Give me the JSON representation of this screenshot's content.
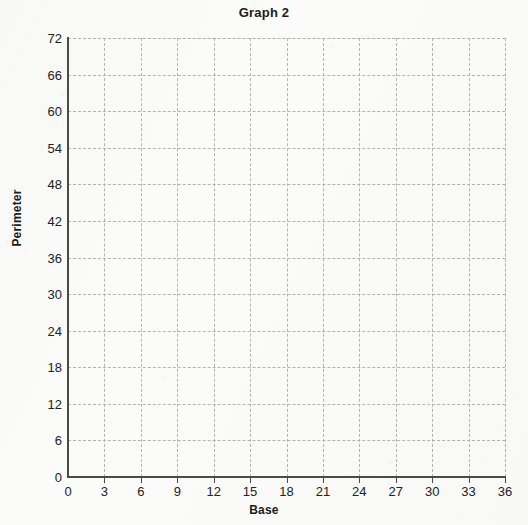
{
  "chart_data": {
    "type": "scatter",
    "title": "Graph 2",
    "xlabel": "Base",
    "ylabel": "Perimeter",
    "xlim": [
      0,
      36
    ],
    "ylim": [
      0,
      72
    ],
    "xticks": [
      0,
      3,
      6,
      9,
      12,
      15,
      18,
      21,
      24,
      27,
      30,
      33,
      36
    ],
    "yticks": [
      0,
      6,
      12,
      18,
      24,
      30,
      36,
      42,
      48,
      54,
      60,
      66,
      72
    ],
    "x_tick_labels": [
      "0",
      "3",
      "6",
      "9",
      "12",
      "15",
      "18",
      "21",
      "24",
      "27",
      "30",
      "33",
      "36"
    ],
    "y_tick_labels": [
      "0",
      "6",
      "12",
      "18",
      "24",
      "30",
      "36",
      "42",
      "48",
      "54",
      "60",
      "66",
      "72"
    ],
    "x_major_step": 3,
    "y_major_step": 6,
    "grid": true,
    "grid_style": "dashed",
    "grid_color": "#b3b3b3",
    "axis_color": "#4a4a4a",
    "background_color": "#fbfbfa",
    "text_color": "#1b1b1b",
    "legend": null,
    "series": [],
    "values": [],
    "x": [],
    "annotations": [],
    "note": "Empty plotting grid; no data points, lines or bars are drawn."
  }
}
